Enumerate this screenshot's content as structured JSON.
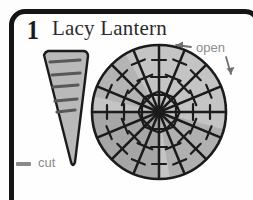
{
  "card": {
    "step_number": "1",
    "title": "Lacy Lantern",
    "frame_color": "#141414",
    "background_color": "#fdfdfd"
  },
  "labels": {
    "open": "open",
    "cut": "cut",
    "legend_dash_color": "#8a8a8a",
    "label_text_color": "#8c8c8c"
  },
  "icons": {
    "open_arrow_left": "arrow-left-icon",
    "open_arrow_down": "arrow-down-icon",
    "cut_legend_dash": "dash-icon"
  },
  "diagram": {
    "cone": {
      "name": "paper-cone-wedge",
      "fill_color": "#b9b9b9",
      "outline_color": "#1b1b1b",
      "cut_line_count": 5,
      "cut_line_color": "#585858",
      "cut_sides": [
        "left",
        "right",
        "left",
        "right",
        "left"
      ]
    },
    "circle": {
      "name": "opened-lantern-circle",
      "fill_light": "#c4c4c4",
      "fill_dark": "#a4a4a4",
      "outline_color": "#1b1b1b",
      "spoke_count": 16,
      "ticks_per_spoke": 4,
      "radius_px": 67,
      "center_x_px": 159,
      "center_y_px": 112
    }
  }
}
